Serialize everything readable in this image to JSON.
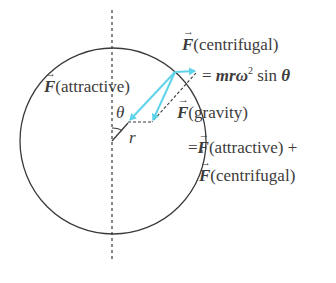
{
  "diagram": {
    "type": "force-diagram",
    "colors": {
      "arrow": "#5fd3ea",
      "line": "#3a3a3a",
      "background": "#ffffff"
    },
    "labels": {
      "vector_symbol": "F",
      "centrifugal_title": "(centrifugal)",
      "centrifugal_formula_eq": "=",
      "centrifugal_formula_mrw": "mrω",
      "centrifugal_formula_sup": "2",
      "centrifugal_formula_sin": "sin",
      "centrifugal_formula_theta": "θ",
      "attractive": "(attractive)",
      "gravity": "(gravity)",
      "gravity_eq": "=",
      "gravity_sum_attractive": "(attractive) +",
      "gravity_sum_centrifugal": "(centrifugal)",
      "angle": "θ",
      "radius": "r"
    }
  }
}
